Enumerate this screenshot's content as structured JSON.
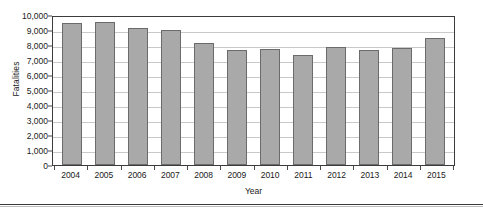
{
  "chart_data": {
    "type": "bar",
    "title": "",
    "xlabel": "Year",
    "ylabel": "Fatalities",
    "categories": [
      "2004",
      "2005",
      "2006",
      "2007",
      "2008",
      "2009",
      "2010",
      "2011",
      "2012",
      "2013",
      "2014",
      "2015"
    ],
    "values": [
      9500,
      9520,
      9130,
      9000,
      8160,
      7640,
      7750,
      7360,
      7900,
      7700,
      7780,
      8500
    ],
    "series": [
      {
        "name": "Fatalities",
        "values": [
          9500,
          9520,
          9130,
          9000,
          8160,
          7640,
          7750,
          7360,
          7900,
          7700,
          7780,
          8500
        ]
      }
    ],
    "ylim": [
      0,
      10000
    ],
    "ytick_values": [
      0,
      1000,
      2000,
      3000,
      4000,
      5000,
      6000,
      7000,
      8000,
      9000,
      10000
    ],
    "ytick_labels": [
      "0",
      "1,000",
      "2,000",
      "3,000",
      "4,000",
      "5,000",
      "6,000",
      "7,000",
      "8,000",
      "9,000",
      "10,000"
    ],
    "grid": true,
    "grid_axis": "y",
    "legend": false,
    "legend_position": "none",
    "bar_color": "#a9a9a9",
    "bar_border_color": "#6b6b6b",
    "grid_color": "#c9c9c9",
    "axis_color": "#3c3c3c",
    "text_color": "#1a1a1a",
    "background": "#ffffff"
  }
}
